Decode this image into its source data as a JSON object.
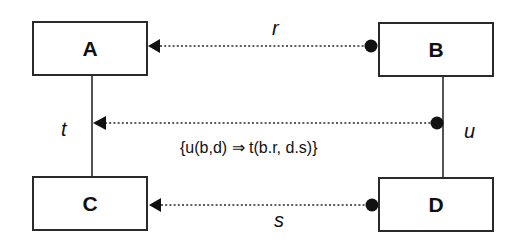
{
  "diagram": {
    "type": "class-relationship-diagram",
    "boxes": [
      {
        "id": "A",
        "label": "A"
      },
      {
        "id": "B",
        "label": "B"
      },
      {
        "id": "C",
        "label": "C"
      },
      {
        "id": "D",
        "label": "D"
      }
    ],
    "relations": [
      {
        "label": "r",
        "from": "B",
        "to": "A",
        "style": "dotted",
        "source_end": "filled-circle",
        "target_end": "filled-arrow"
      },
      {
        "label": "s",
        "from": "D",
        "to": "C",
        "style": "dotted",
        "source_end": "filled-circle",
        "target_end": "filled-arrow"
      },
      {
        "label": "t",
        "between": [
          "A",
          "C"
        ],
        "style": "solid"
      },
      {
        "label": "u",
        "between": [
          "B",
          "D"
        ],
        "style": "solid"
      },
      {
        "label": "constraint",
        "from": "u",
        "to": "t",
        "style": "dotted",
        "source_end": "filled-circle",
        "target_end": "filled-arrow"
      }
    ],
    "labels": {
      "r": "r",
      "s": "s",
      "t": "t",
      "u": "u",
      "constraint": "{u(b,d) ⇒ t(b.r, d.s)}"
    },
    "colors": {
      "line": "#2a2a2a",
      "background": "#ffffff"
    }
  }
}
